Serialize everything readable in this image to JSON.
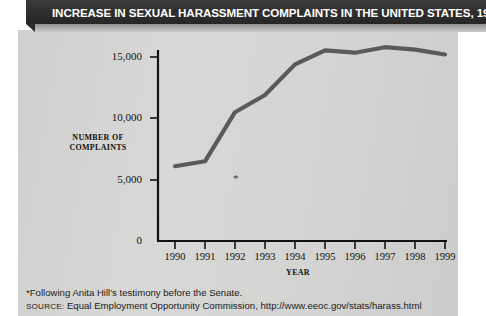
{
  "title": "INCREASE IN SEXUAL HARASSMENT COMPLAINTS IN THE UNITED STATES,  1990–99",
  "axes": {
    "ylabel_line1": "NUMBER OF",
    "ylabel_line2": "COMPLAINTS",
    "xlabel": "YEAR"
  },
  "notes": {
    "footnote": "*Following Anita Hill's testimony before the Senate.",
    "source_prefix": "SOURCE:",
    "source_text": " Equal Employment Opportunity Commission, http://www.eeoc.gov/stats/harass.html"
  },
  "colors": {
    "line": "#5a5a5a",
    "panel": "#d6d6d4",
    "titlebar": "#2e2e2e",
    "axis": "#111111"
  },
  "chart_data": {
    "type": "line",
    "title": "INCREASE IN SEXUAL HARASSMENT COMPLAINTS IN THE UNITED STATES, 1990–99",
    "xlabel": "YEAR",
    "ylabel": "NUMBER OF COMPLAINTS",
    "categories": [
      "1990",
      "1991",
      "1992",
      "1993",
      "1994",
      "1995",
      "1996",
      "1997",
      "1998",
      "1999"
    ],
    "values": [
      6100,
      6500,
      10500,
      11900,
      14400,
      15550,
      15350,
      15800,
      15600,
      15200
    ],
    "ytick_labels": [
      "0",
      "5,000",
      "10,000",
      "15,000"
    ],
    "ytick_values": [
      0,
      5000,
      10000,
      15000
    ],
    "ylim": [
      0,
      16500
    ],
    "grid": false,
    "legend": false,
    "annotations": [
      {
        "text": "*",
        "year": "1993",
        "note": "Following Anita Hill's testimony before the Senate."
      }
    ]
  }
}
